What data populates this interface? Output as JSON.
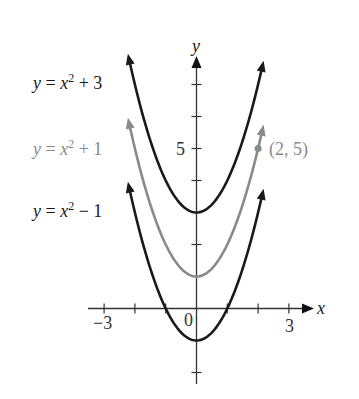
{
  "chart_data": {
    "type": "line",
    "title": "",
    "xlabel": "x",
    "ylabel": "y",
    "xlim": [
      -3.5,
      3.8
    ],
    "ylim": [
      -2.7,
      8.0
    ],
    "x_ticks": [
      -3,
      -2,
      -1,
      1,
      2,
      3
    ],
    "x_tick_labels": [
      {
        "value": -3,
        "label": "−3"
      },
      {
        "value": 3,
        "label": "3"
      }
    ],
    "y_ticks": [
      -2,
      1,
      2,
      3,
      4,
      5,
      6,
      7
    ],
    "y_tick_labels": [
      {
        "value": 5,
        "label": "5"
      }
    ],
    "origin_label": "0",
    "grid": false,
    "legend": "inline labels to the left of curves",
    "series": [
      {
        "name": "y = x² + 3",
        "expr": "x^2 + 3",
        "c": 3,
        "x_range": [
          -2.2,
          2.15
        ],
        "color": "#1a1a1a",
        "label_y": 3
      },
      {
        "name": "y = x² + 1",
        "expr": "x^2 + 1",
        "c": 1,
        "x_range": [
          -2.2,
          2.15
        ],
        "color": "#8a8a8a",
        "label_y": 1
      },
      {
        "name": "y = x² − 1",
        "expr": "x^2 - 1",
        "c": -1,
        "x_range": [
          -2.2,
          2.15
        ],
        "color": "#1a1a1a",
        "label_y": -1
      }
    ],
    "annotations": [
      {
        "type": "point",
        "x": 2,
        "y": 5,
        "label": "(2, 5)",
        "color": "#8a8a8a"
      }
    ]
  },
  "labels": {
    "curve_top": {
      "lhs": "y",
      "eq": " = ",
      "var": "x",
      "exp": "2",
      "rest": " + 3"
    },
    "curve_mid": {
      "lhs": "y",
      "eq": " = ",
      "var": "x",
      "exp": "2",
      "rest": " + 1"
    },
    "curve_bot": {
      "lhs": "y",
      "eq": " = ",
      "var": "x",
      "exp": "2",
      "rest": " − 1"
    },
    "point": "(2, 5)",
    "x_axis": "x",
    "y_axis": "y",
    "tick_neg3": "−3",
    "tick_pos3": "3",
    "tick_5": "5",
    "origin": "0"
  },
  "colors": {
    "black": "#1a1a1a",
    "gray": "#8a8a8a",
    "axis": "#333333"
  }
}
